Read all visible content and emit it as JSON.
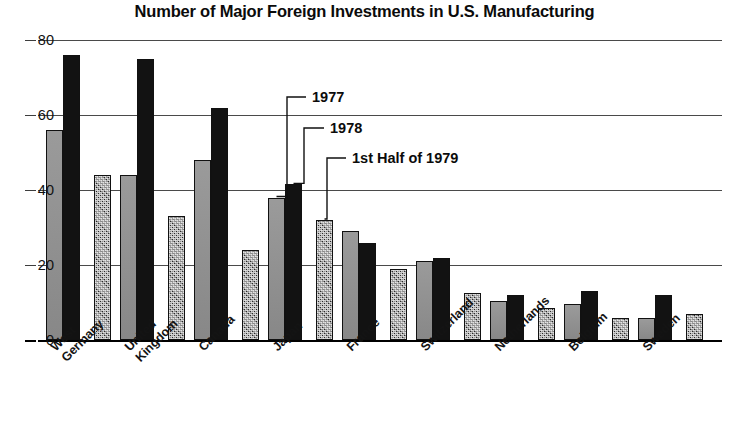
{
  "chart_data": {
    "type": "bar",
    "title": "Number of Major Foreign Investments in U.S. Manufacturing",
    "xlabel": "",
    "ylabel": "",
    "ylim": [
      0,
      80
    ],
    "yticks": [
      0,
      20,
      40,
      60,
      80
    ],
    "ytick_labels": [
      "0",
      "20",
      "40",
      "60",
      "80"
    ],
    "grid": true,
    "legend_position": "none",
    "categories": [
      "West\nGermany",
      "United\nKingdom",
      "Canada",
      "Japan",
      "France",
      "Switzerland",
      "Netherlands",
      "Belgium",
      "Sweden"
    ],
    "series": [
      {
        "name": "1977",
        "color": "#8f8f8f",
        "values": [
          56,
          44,
          48,
          38,
          29,
          21,
          10.5,
          9.5,
          6
        ]
      },
      {
        "name": "1978",
        "color": "#121212",
        "values": [
          76,
          75,
          62,
          41.5,
          26,
          22,
          12,
          13,
          12
        ]
      },
      {
        "name": "1st Half of 1979",
        "color": "#6b6b6b",
        "values": [
          44,
          33,
          24,
          32,
          19,
          12.5,
          8.5,
          6,
          7
        ]
      }
    ],
    "annotations": [
      {
        "text": "1977",
        "target_series": "1977",
        "target_category": "Japan"
      },
      {
        "text": "1978",
        "target_series": "1978",
        "target_category": "Japan"
      },
      {
        "text": "1st Half of 1979",
        "target_series": "1st Half of 1979",
        "target_category": "Japan"
      }
    ]
  }
}
